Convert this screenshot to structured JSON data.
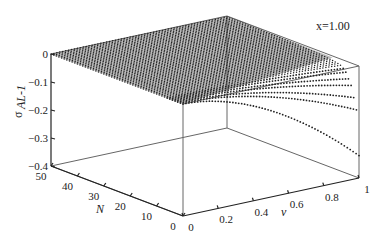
{
  "chart_data": {
    "type": "surface3d",
    "title": "",
    "annotation": "x=1.00",
    "xlabel": "v",
    "ylabel": "N",
    "zlabel": "σ_{AL-1}",
    "zlabel_main": "σ",
    "zlabel_sub": "AL-1",
    "x_ticks": [
      "0",
      "0.2",
      "0.4",
      "0.6",
      "0.8",
      "1"
    ],
    "x_tick_values": [
      0,
      0.2,
      0.4,
      0.6,
      0.8,
      1
    ],
    "y_ticks": [
      "0",
      "10",
      "20",
      "30",
      "40",
      "50"
    ],
    "y_tick_values": [
      0,
      10,
      20,
      30,
      40,
      50
    ],
    "z_ticks": [
      "0",
      "-0.1",
      "-0.2",
      "-0.3",
      "-0.4"
    ],
    "z_tick_values": [
      0,
      -0.1,
      -0.2,
      -0.3,
      -0.4
    ],
    "xlim": [
      0,
      1
    ],
    "ylim": [
      0,
      50
    ],
    "zlim": [
      -0.4,
      0
    ],
    "grid": false,
    "surface_description": "Dotted surface: σ ≈ 0 for most N, dropping with v for small N; curves at v=1 reach about -0.03, -0.04, -0.06, -0.08, -0.12, -0.16, -0.32 for the lowest N rows",
    "sample_curves_at_v1": [
      {
        "N": 0,
        "sigma": -0.32
      },
      {
        "N": 1,
        "sigma": -0.16
      },
      {
        "N": 2,
        "sigma": -0.12
      },
      {
        "N": 3,
        "sigma": -0.08
      },
      {
        "N": 4,
        "sigma": -0.06
      },
      {
        "N": 5,
        "sigma": -0.04
      },
      {
        "N": 6,
        "sigma": -0.03
      }
    ]
  }
}
